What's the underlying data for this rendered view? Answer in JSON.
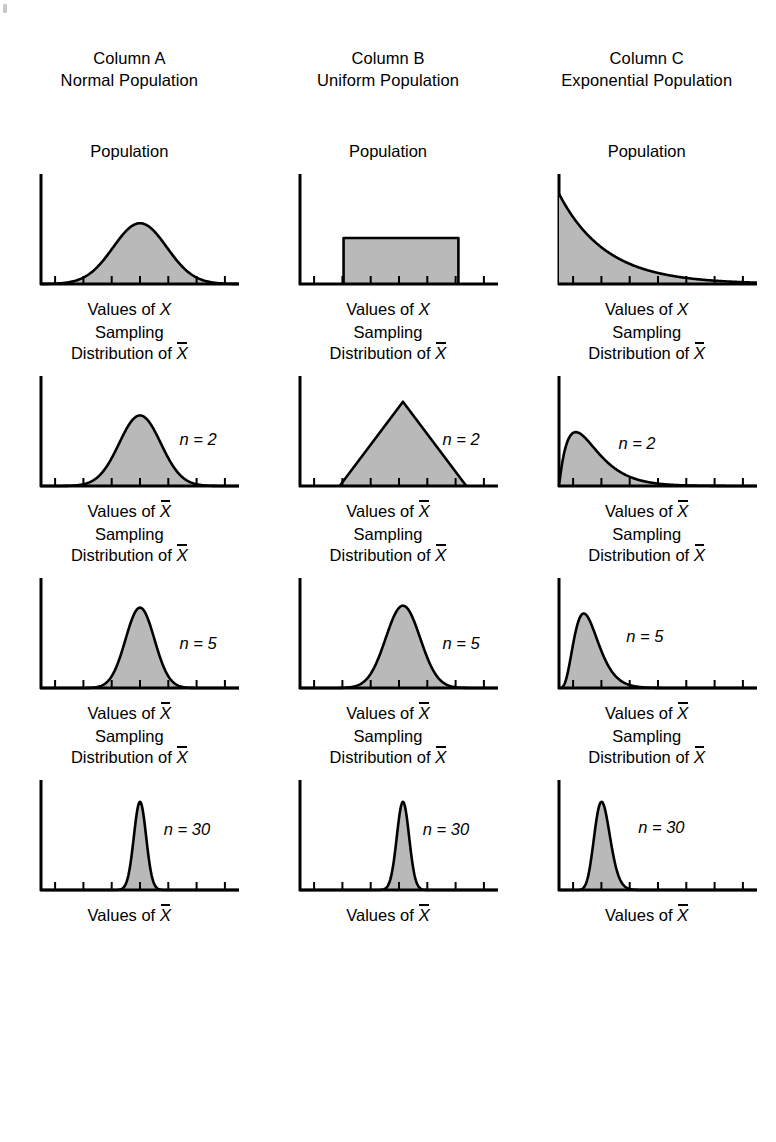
{
  "figure": {
    "title_hidden": "",
    "fill_color": "#b9b9b9",
    "stroke_color": "#000000",
    "background": "#ffffff"
  },
  "columns": [
    {
      "id": "A",
      "head_line1": "Column A",
      "head_line2": "Normal Population"
    },
    {
      "id": "B",
      "head_line1": "Column B",
      "head_line2": "Uniform Population"
    },
    {
      "id": "C",
      "head_line1": "Column C",
      "head_line2": "Exponential Population"
    }
  ],
  "rows": [
    {
      "id": "population",
      "title_line1": "Population",
      "title_line2": "",
      "n_label": "",
      "axis_label_prefix": "Values of",
      "axis_label_var": "X",
      "axis_var_overbar": false
    },
    {
      "id": "n2",
      "title_line1": "Sampling",
      "title_line2": "Distribution of",
      "n_label": "n = 2",
      "axis_label_prefix": "Values of",
      "axis_label_var": "X",
      "axis_var_overbar": true
    },
    {
      "id": "n5",
      "title_line1": "Sampling",
      "title_line2": "Distribution of",
      "n_label": "n = 5",
      "axis_label_prefix": "Values of",
      "axis_label_var": "X",
      "axis_var_overbar": true
    },
    {
      "id": "n30",
      "title_line1": "Sampling",
      "title_line2": "Distribution of",
      "n_label": "n = 30",
      "axis_label_prefix": "Values of",
      "axis_label_var": "X",
      "axis_var_overbar": true
    }
  ],
  "chart_data": {
    "type": "area",
    "xlabel": "Values of X",
    "ylabel": "",
    "grid": false,
    "legend": "none",
    "axis_ticks_x": 7,
    "xlim": [
      0,
      1
    ],
    "ylim": [
      0,
      1
    ],
    "panels": [
      {
        "column": "A",
        "row": "population",
        "distribution": "normal",
        "caption": "Population",
        "n": null,
        "shape": "bell",
        "mean": 0.5,
        "sd": 0.135,
        "peak_height": 0.62
      },
      {
        "column": "A",
        "row": "n2",
        "distribution": "normal",
        "caption": "Sampling Distribution of X̄",
        "n": 2,
        "shape": "bell",
        "mean": 0.5,
        "sd": 0.105,
        "peak_height": 0.72
      },
      {
        "column": "A",
        "row": "n5",
        "distribution": "normal",
        "caption": "Sampling Distribution of X̄",
        "n": 5,
        "shape": "bell",
        "mean": 0.5,
        "sd": 0.073,
        "peak_height": 0.82
      },
      {
        "column": "A",
        "row": "n30",
        "distribution": "normal",
        "caption": "Sampling Distribution of X̄",
        "n": 30,
        "shape": "bell",
        "mean": 0.5,
        "sd": 0.031,
        "peak_height": 0.9
      },
      {
        "column": "B",
        "row": "population",
        "distribution": "uniform",
        "caption": "Population",
        "n": null,
        "shape": "rectangle",
        "a": 0.22,
        "b": 0.8,
        "height": 0.47
      },
      {
        "column": "B",
        "row": "n2",
        "distribution": "uniform",
        "caption": "Sampling Distribution of X̄",
        "n": 2,
        "shape": "triangle",
        "a": 0.2,
        "peak_x": 0.52,
        "b": 0.84,
        "peak_height": 0.86
      },
      {
        "column": "B",
        "row": "n5",
        "distribution": "uniform",
        "caption": "Sampling Distribution of X̄",
        "n": 5,
        "shape": "bell",
        "mean": 0.52,
        "sd": 0.087,
        "peak_height": 0.84
      },
      {
        "column": "B",
        "row": "n30",
        "distribution": "uniform",
        "caption": "Sampling Distribution of X̄",
        "n": 30,
        "shape": "bell",
        "mean": 0.52,
        "sd": 0.031,
        "peak_height": 0.9
      },
      {
        "column": "C",
        "row": "population",
        "distribution": "exponential",
        "caption": "Population",
        "n": null,
        "shape": "exponential-decay",
        "rate": 4.2,
        "peak_height": 0.92
      },
      {
        "column": "C",
        "row": "n2",
        "distribution": "exponential",
        "caption": "Sampling Distribution of X̄",
        "n": 2,
        "shape": "gamma",
        "k": 2,
        "mode_x": 0.085,
        "peak_height": 0.55
      },
      {
        "column": "C",
        "row": "n5",
        "distribution": "exponential",
        "caption": "Sampling Distribution of X̄",
        "n": 5,
        "shape": "gamma",
        "k": 5,
        "mode_x": 0.125,
        "peak_height": 0.76
      },
      {
        "column": "C",
        "row": "n30",
        "distribution": "exponential",
        "caption": "Sampling Distribution of X̄",
        "n": 30,
        "shape": "gamma",
        "k": 30,
        "mode_x": 0.215,
        "peak_height": 0.9
      }
    ]
  }
}
